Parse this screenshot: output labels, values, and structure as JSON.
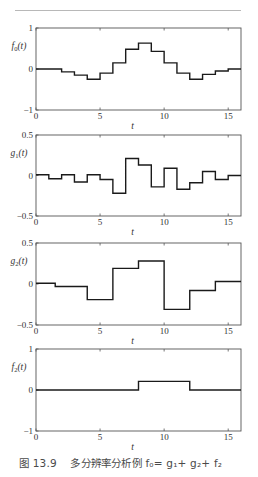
{
  "figure": {
    "caption_prefix": "图 13.9",
    "caption_text": "多分辨率分析例",
    "caption_formula": "f₀= g₁+ g₂+ f₂"
  },
  "chart_data": [
    {
      "type": "line",
      "style": "step",
      "ylabel": "f0(t)",
      "xlabel": "t",
      "xlim": [
        0,
        16
      ],
      "ylim": [
        -1,
        1
      ],
      "xticks": [
        "0",
        "5",
        "10",
        "15"
      ],
      "xtick_values": [
        0,
        5,
        10,
        15
      ],
      "yticks": [
        "-1",
        "0",
        "1"
      ],
      "ytick_values": [
        -1,
        0,
        1
      ],
      "steps": {
        "edges": [
          0,
          2,
          3,
          4,
          5,
          6,
          7,
          8,
          9,
          10,
          11,
          12,
          13,
          14,
          15,
          16
        ],
        "values": [
          0,
          -0.07,
          -0.15,
          -0.25,
          -0.1,
          0.15,
          0.48,
          0.63,
          0.43,
          0.15,
          -0.1,
          -0.25,
          -0.13,
          -0.05,
          0
        ]
      },
      "grid": false
    },
    {
      "type": "line",
      "style": "step",
      "ylabel": "g1(t)",
      "xlabel": "t",
      "xlim": [
        0,
        16
      ],
      "ylim": [
        -0.5,
        0.5
      ],
      "xticks": [
        "0",
        "5",
        "10",
        "15"
      ],
      "xtick_values": [
        0,
        5,
        10,
        15
      ],
      "yticks": [
        "-0.5",
        "0",
        "0.5"
      ],
      "ytick_values": [
        -0.5,
        0,
        0.5
      ],
      "steps": {
        "edges": [
          0,
          1,
          2,
          3,
          4,
          5,
          6,
          7,
          8,
          9,
          10,
          11,
          12,
          13,
          14,
          15,
          16
        ],
        "values": [
          0.01,
          -0.04,
          0.01,
          -0.08,
          0.01,
          -0.05,
          -0.22,
          0.21,
          0.13,
          -0.14,
          0.09,
          -0.17,
          -0.09,
          0.05,
          -0.05,
          0.0
        ]
      },
      "grid": false
    },
    {
      "type": "line",
      "style": "step",
      "ylabel": "g2(t)",
      "xlabel": "t",
      "xlim": [
        0,
        16
      ],
      "ylim": [
        -0.5,
        0.5
      ],
      "xticks": [
        "0",
        "5",
        "10",
        "15"
      ],
      "xtick_values": [
        0,
        5,
        10,
        15
      ],
      "yticks": [
        "-0.5",
        "0",
        "0.5"
      ],
      "ytick_values": [
        -0.5,
        0,
        0.5
      ],
      "steps": {
        "edges": [
          0,
          1.5,
          4,
          6,
          8,
          10,
          12,
          14,
          16
        ],
        "values": [
          0.01,
          -0.03,
          -0.19,
          0.19,
          0.28,
          -0.31,
          -0.08,
          0.03
        ]
      },
      "grid": false
    },
    {
      "type": "line",
      "style": "step",
      "ylabel": "f2(t)",
      "xlabel": "t",
      "xlim": [
        0,
        16
      ],
      "ylim": [
        -1,
        1
      ],
      "xticks": [
        "0",
        "5",
        "10",
        "15"
      ],
      "xtick_values": [
        0,
        5,
        10,
        15
      ],
      "yticks": [
        "-1",
        "0",
        "1"
      ],
      "ytick_values": [
        -1,
        0,
        1
      ],
      "steps": {
        "edges": [
          0,
          8,
          12,
          16
        ],
        "values": [
          0,
          0.21,
          0
        ]
      },
      "grid": false
    }
  ]
}
